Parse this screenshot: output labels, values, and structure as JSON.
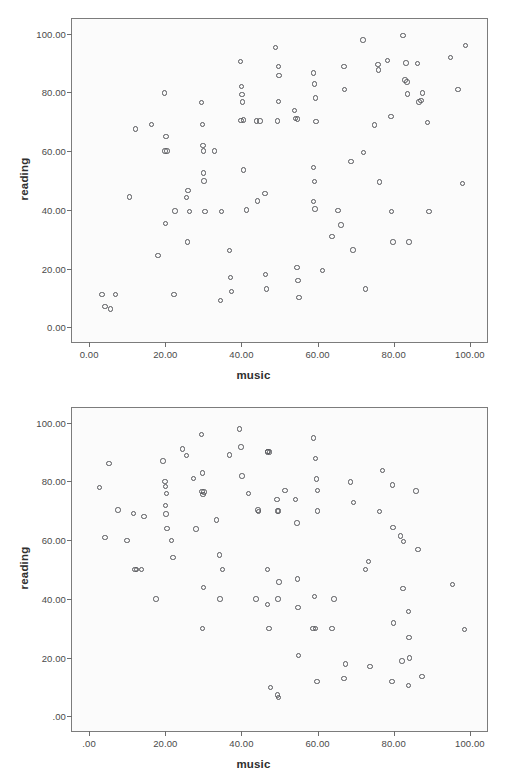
{
  "page": {
    "background_color": "#ffffff",
    "plot_background_color": "#fbfbfb",
    "frame_color": "#7c7c7c",
    "marker_color": "#55565a"
  },
  "chart_data": [
    {
      "id": "figure-1",
      "type": "scatter",
      "title": "",
      "xlabel": "music",
      "ylabel": "reading",
      "xlim": [
        -4.5,
        104.5
      ],
      "ylim": [
        -5.0,
        105.0
      ],
      "grid": false,
      "legend": null,
      "x_ticks": [
        0,
        20,
        40,
        60,
        80,
        100
      ],
      "x_tick_labels": [
        "0.00",
        "20.00",
        "40.00",
        "60.00",
        "80.00",
        "100.00"
      ],
      "y_ticks": [
        0,
        20,
        40,
        60,
        80,
        100
      ],
      "y_tick_labels": [
        "0.00",
        "20.00",
        "40.00",
        "60.00",
        "80.00",
        "100.00"
      ],
      "marker": "open-circle",
      "n_points": 100,
      "points": [
        [
          3.4,
          11.2
        ],
        [
          4.2,
          7.0
        ],
        [
          5.6,
          6.2
        ],
        [
          7.0,
          11.2
        ],
        [
          10.6,
          44.4
        ],
        [
          12.1,
          67.5
        ],
        [
          16.3,
          69.0
        ],
        [
          18.1,
          24.4
        ],
        [
          19.8,
          79.8
        ],
        [
          20.2,
          65.0
        ],
        [
          20.4,
          60.1
        ],
        [
          20.1,
          35.3
        ],
        [
          22.3,
          11.2
        ],
        [
          22.6,
          39.6
        ],
        [
          25.5,
          44.2
        ],
        [
          26.0,
          46.5
        ],
        [
          25.9,
          29.0
        ],
        [
          26.3,
          39.5
        ],
        [
          29.5,
          76.5
        ],
        [
          29.9,
          61.9
        ],
        [
          30.0,
          60.0
        ],
        [
          29.7,
          69.1
        ],
        [
          30.1,
          52.6
        ],
        [
          30.2,
          49.8
        ],
        [
          33.0,
          60.1
        ],
        [
          34.5,
          9.1
        ],
        [
          34.8,
          39.5
        ],
        [
          36.8,
          26.2
        ],
        [
          37.2,
          17.0
        ],
        [
          37.4,
          12.1
        ],
        [
          39.8,
          90.6
        ],
        [
          40.0,
          82.0
        ],
        [
          40.1,
          79.3
        ],
        [
          40.2,
          76.8
        ],
        [
          39.9,
          70.5
        ],
        [
          40.6,
          70.6
        ],
        [
          40.6,
          53.6
        ],
        [
          41.4,
          39.9
        ],
        [
          44.0,
          70.3
        ],
        [
          44.2,
          43.0
        ],
        [
          46.2,
          45.5
        ],
        [
          46.4,
          17.9
        ],
        [
          46.6,
          13.0
        ],
        [
          49.0,
          95.2
        ],
        [
          49.8,
          88.8
        ],
        [
          49.9,
          85.8
        ],
        [
          49.7,
          76.9
        ],
        [
          49.5,
          70.2
        ],
        [
          54.0,
          73.8
        ],
        [
          54.8,
          71.0
        ],
        [
          54.6,
          20.3
        ],
        [
          54.9,
          15.9
        ],
        [
          55.1,
          10.1
        ],
        [
          58.9,
          86.6
        ],
        [
          59.2,
          82.8
        ],
        [
          59.4,
          78.1
        ],
        [
          59.6,
          70.0
        ],
        [
          59.0,
          54.4
        ],
        [
          59.2,
          49.7
        ],
        [
          59.0,
          42.9
        ],
        [
          59.3,
          40.3
        ],
        [
          61.3,
          19.3
        ],
        [
          63.8,
          31.0
        ],
        [
          65.4,
          39.8
        ],
        [
          66.2,
          34.8
        ],
        [
          66.9,
          88.8
        ],
        [
          67.0,
          81.0
        ],
        [
          68.8,
          56.4
        ],
        [
          69.3,
          26.3
        ],
        [
          71.9,
          97.8
        ],
        [
          72.1,
          59.5
        ],
        [
          72.6,
          13.0
        ],
        [
          74.9,
          68.9
        ],
        [
          75.9,
          89.6
        ],
        [
          76.0,
          87.7
        ],
        [
          76.2,
          49.5
        ],
        [
          78.4,
          90.8
        ],
        [
          79.3,
          71.9
        ],
        [
          79.4,
          39.5
        ],
        [
          79.8,
          29.0
        ],
        [
          82.4,
          99.4
        ],
        [
          83.0,
          84.2
        ],
        [
          83.5,
          83.5
        ],
        [
          83.2,
          90.0
        ],
        [
          83.6,
          79.5
        ],
        [
          84.0,
          29.0
        ],
        [
          86.2,
          89.8
        ],
        [
          86.6,
          76.8
        ],
        [
          87.2,
          77.3
        ],
        [
          87.5,
          79.8
        ],
        [
          88.9,
          69.8
        ],
        [
          89.3,
          39.5
        ],
        [
          94.9,
          91.9
        ],
        [
          96.9,
          81.0
        ],
        [
          98.1,
          48.9
        ],
        [
          98.8,
          96.0
        ],
        [
          44.9,
          70.2
        ],
        [
          30.4,
          39.5
        ],
        [
          54.2,
          71.1
        ],
        [
          19.9,
          60.0
        ]
      ]
    },
    {
      "id": "figure-2",
      "type": "scatter",
      "title": "",
      "xlabel": "music",
      "ylabel": "reading",
      "xlim": [
        -4.5,
        104.5
      ],
      "ylim": [
        -5.0,
        105.0
      ],
      "grid": false,
      "legend": null,
      "x_ticks": [
        0,
        20,
        40,
        60,
        80,
        100
      ],
      "x_tick_labels": [
        ".00",
        "20.00",
        "40.00",
        "60.00",
        "80.00",
        "100.00"
      ],
      "y_ticks": [
        0,
        20,
        40,
        60,
        80,
        100
      ],
      "y_tick_labels": [
        ".00",
        "20.00",
        "40.00",
        "60.00",
        "80.00",
        "100.00"
      ],
      "marker": "open-circle",
      "n_points": 100,
      "points": [
        [
          2.8,
          78.0
        ],
        [
          4.2,
          60.8
        ],
        [
          5.2,
          86.0
        ],
        [
          7.6,
          70.2
        ],
        [
          9.9,
          59.8
        ],
        [
          11.6,
          69.0
        ],
        [
          12.0,
          50.0
        ],
        [
          13.7,
          50.0
        ],
        [
          14.4,
          68.0
        ],
        [
          17.6,
          40.0
        ],
        [
          19.4,
          87.0
        ],
        [
          19.9,
          79.9
        ],
        [
          20.0,
          78.2
        ],
        [
          20.1,
          71.8
        ],
        [
          20.2,
          68.9
        ],
        [
          20.4,
          63.9
        ],
        [
          21.6,
          59.8
        ],
        [
          22.0,
          54.0
        ],
        [
          24.6,
          91.0
        ],
        [
          25.6,
          88.8
        ],
        [
          27.4,
          81.0
        ],
        [
          28.1,
          63.8
        ],
        [
          29.5,
          95.9
        ],
        [
          29.8,
          82.8
        ],
        [
          29.6,
          76.5
        ],
        [
          29.9,
          75.6
        ],
        [
          30.0,
          43.9
        ],
        [
          29.8,
          30.0
        ],
        [
          33.4,
          66.8
        ],
        [
          34.2,
          54.9
        ],
        [
          35.0,
          50.0
        ],
        [
          34.4,
          40.0
        ],
        [
          36.8,
          89.0
        ],
        [
          39.5,
          97.8
        ],
        [
          39.9,
          91.7
        ],
        [
          40.1,
          81.8
        ],
        [
          41.8,
          75.8
        ],
        [
          43.8,
          40.0
        ],
        [
          44.3,
          70.2
        ],
        [
          44.5,
          69.8
        ],
        [
          46.9,
          90.0
        ],
        [
          47.4,
          90.0
        ],
        [
          46.8,
          50.0
        ],
        [
          46.9,
          38.0
        ],
        [
          47.2,
          30.0
        ],
        [
          47.6,
          9.8
        ],
        [
          49.3,
          73.8
        ],
        [
          49.8,
          69.9
        ],
        [
          49.9,
          45.8
        ],
        [
          49.6,
          40.0
        ],
        [
          49.4,
          7.2
        ],
        [
          49.7,
          6.4
        ],
        [
          51.4,
          76.9
        ],
        [
          54.2,
          73.8
        ],
        [
          54.6,
          65.8
        ],
        [
          54.7,
          46.8
        ],
        [
          54.9,
          37.0
        ],
        [
          55.0,
          20.8
        ],
        [
          58.9,
          94.8
        ],
        [
          59.4,
          87.8
        ],
        [
          59.7,
          80.8
        ],
        [
          59.9,
          76.9
        ],
        [
          60.0,
          69.9
        ],
        [
          59.2,
          40.9
        ],
        [
          59.5,
          30.0
        ],
        [
          59.8,
          11.8
        ],
        [
          63.8,
          30.0
        ],
        [
          64.3,
          39.9
        ],
        [
          66.9,
          12.8
        ],
        [
          67.4,
          17.8
        ],
        [
          68.6,
          79.8
        ],
        [
          69.4,
          72.8
        ],
        [
          72.6,
          50.0
        ],
        [
          73.4,
          52.8
        ],
        [
          73.8,
          16.9
        ],
        [
          77.0,
          83.8
        ],
        [
          76.2,
          69.8
        ],
        [
          79.6,
          78.8
        ],
        [
          79.8,
          64.4
        ],
        [
          79.9,
          31.8
        ],
        [
          79.5,
          11.8
        ],
        [
          81.8,
          61.4
        ],
        [
          82.4,
          43.6
        ],
        [
          82.2,
          18.8
        ],
        [
          82.6,
          59.6
        ],
        [
          83.8,
          35.8
        ],
        [
          84.0,
          26.8
        ],
        [
          84.2,
          19.8
        ],
        [
          83.9,
          10.6
        ],
        [
          85.8,
          76.8
        ],
        [
          86.4,
          56.8
        ],
        [
          87.4,
          13.6
        ],
        [
          95.4,
          44.8
        ],
        [
          98.6,
          29.6
        ],
        [
          20.3,
          75.8
        ],
        [
          12.4,
          50.0
        ],
        [
          30.2,
          76.4
        ],
        [
          49.5,
          69.9
        ],
        [
          47.0,
          90.1
        ],
        [
          58.8,
          30.0
        ]
      ]
    }
  ]
}
